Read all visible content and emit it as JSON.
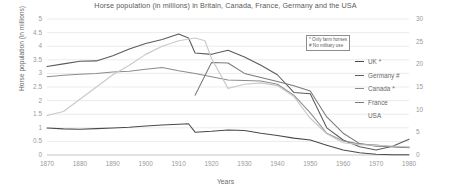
{
  "chart_data": {
    "type": "line",
    "title": "Horse population (in millions) in Britain, Canada, France, Germany and the USA",
    "xlabel": "Years",
    "ylabel": "Horse population (in millions)",
    "ylabel_right": "",
    "xlim": [
      1870,
      1980
    ],
    "ylim": [
      0,
      5
    ],
    "ylim_right": [
      0,
      30
    ],
    "grid": true,
    "legend_position": "right",
    "x_ticks": [
      1870,
      1880,
      1890,
      1900,
      1910,
      1920,
      1930,
      1940,
      1950,
      1960,
      1970,
      1980
    ],
    "y_ticks_left": [
      "0",
      "0.5",
      "1",
      "1.5",
      "2",
      "2.5",
      "3",
      "3.5",
      "4",
      "4.5",
      "5"
    ],
    "y_ticks_right": [
      "0",
      "5",
      "10",
      "15",
      "20",
      "25",
      "30"
    ],
    "annotations": [
      "* Only farm horses",
      "# No military use"
    ],
    "series": [
      {
        "name": "UK *",
        "color": "#4a4a4a",
        "axis": "left",
        "x": [
          1870,
          1875,
          1880,
          1885,
          1890,
          1895,
          1900,
          1905,
          1910,
          1913,
          1915,
          1920,
          1925,
          1930,
          1935,
          1940,
          1945,
          1950,
          1955,
          1960,
          1965,
          1970,
          1975,
          1980
        ],
        "values": [
          0.99,
          0.96,
          0.95,
          0.97,
          0.99,
          1.02,
          1.07,
          1.1,
          1.13,
          1.15,
          0.84,
          0.87,
          0.92,
          0.9,
          0.8,
          0.72,
          0.62,
          0.55,
          0.36,
          0.18,
          0.08,
          0.03,
          0.01,
          0.01
        ]
      },
      {
        "name": "Germany #",
        "color": "#5b5b5b",
        "axis": "left",
        "x": [
          1870,
          1875,
          1880,
          1885,
          1890,
          1895,
          1900,
          1905,
          1910,
          1913,
          1915,
          1920,
          1925,
          1930,
          1935,
          1940,
          1945,
          1950,
          1955,
          1960,
          1965,
          1970,
          1975,
          1980
        ],
        "values": [
          3.25,
          3.35,
          3.45,
          3.46,
          3.65,
          3.9,
          4.1,
          4.25,
          4.45,
          4.3,
          3.75,
          3.7,
          3.85,
          3.6,
          3.3,
          2.95,
          2.3,
          2.25,
          1.0,
          0.55,
          0.3,
          0.18,
          0.32,
          0.58
        ]
      },
      {
        "name": "Canada *",
        "color": "#8c8c8c",
        "axis": "left",
        "x": [
          1870,
          1875,
          1880,
          1885,
          1890,
          1895,
          1900,
          1905,
          1910,
          1915,
          1920,
          1925,
          1930,
          1935,
          1940,
          1945,
          1950,
          1955,
          1960,
          1965,
          1970,
          1975,
          1980
        ],
        "values": [
          2.88,
          2.93,
          2.97,
          3.0,
          3.05,
          3.08,
          3.15,
          3.22,
          3.1,
          3.0,
          2.88,
          2.76,
          2.74,
          2.72,
          2.6,
          2.2,
          1.55,
          0.8,
          0.52,
          0.4,
          0.37,
          0.3,
          0.27
        ]
      },
      {
        "name": "France",
        "color": "#7a7a7a",
        "axis": "left",
        "x": [
          1915,
          1920,
          1925,
          1930,
          1935,
          1940,
          1945,
          1950,
          1955,
          1960,
          1965,
          1970,
          1975,
          1980
        ],
        "values": [
          2.2,
          3.4,
          3.38,
          3.0,
          2.85,
          2.7,
          2.55,
          2.35,
          1.4,
          0.8,
          0.42,
          0.32,
          0.3,
          0.28
        ]
      },
      {
        "name": "USA",
        "color": "#c9c9c9",
        "axis": "left",
        "x": [
          1870,
          1875,
          1880,
          1885,
          1890,
          1895,
          1900,
          1905,
          1910,
          1915,
          1918,
          1920,
          1925,
          1930,
          1935,
          1940,
          1945,
          1950,
          1955,
          1960,
          1965,
          1970,
          1975,
          1980
        ],
        "values": [
          1.45,
          1.6,
          2.05,
          2.5,
          2.95,
          3.3,
          3.7,
          4.0,
          4.2,
          4.3,
          4.2,
          3.55,
          2.45,
          2.6,
          2.65,
          2.55,
          2.15,
          1.35,
          0.78,
          0.45,
          0.38,
          0.35,
          0.33,
          0.3
        ]
      }
    ]
  }
}
